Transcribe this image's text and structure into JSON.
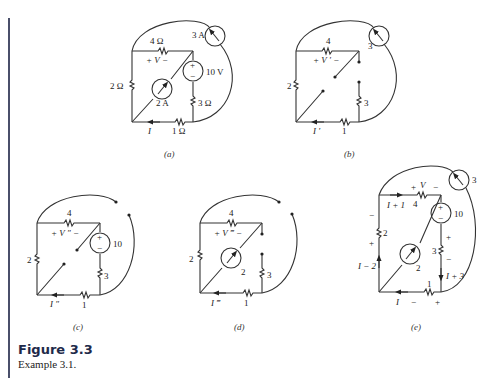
{
  "figure": {
    "title": "Figure 3.3",
    "caption": "Example 3.1."
  },
  "panels": {
    "a": {
      "label": "(a)",
      "r_top": "4 Ω",
      "r_left": "2 Ω",
      "r_right": "3 Ω",
      "r_bottom": "1 Ω",
      "v_source": "10 V",
      "v_plus": "+",
      "v_minus": "−",
      "i_source_diag": "2 A",
      "i_source_arc": "3 A",
      "voltage_label": "+  V  −",
      "current_label": "I"
    },
    "b": {
      "label": "(b)",
      "r_top": "4",
      "r_left": "2",
      "r_right": "3",
      "r_bottom": "1",
      "i_source_arc": "3",
      "voltage_label": "+ V ′ −",
      "current_label": "I ′"
    },
    "c": {
      "label": "(c)",
      "r_top": "4",
      "r_left": "2",
      "r_right": "3",
      "r_bottom": "1",
      "v_source": "10",
      "v_plus": "+",
      "v_minus": "−",
      "voltage_label": "+ V ″ −",
      "current_label": "I ″"
    },
    "d": {
      "label": "(d)",
      "r_top": "4",
      "r_left": "2",
      "r_right": "3",
      "r_bottom": "1",
      "i_source_diag": "2",
      "voltage_label": "+ V ‴ −",
      "current_label": "I ‴"
    },
    "e": {
      "label": "(e)",
      "r_top": "4",
      "r_left": "2",
      "r_right": "3",
      "r_bottom": "1",
      "v_source": "10",
      "v_plus": "+",
      "v_minus": "−",
      "i_source_diag": "2",
      "i_source_arc": "3",
      "top_v_plus": "+",
      "top_v_label": "V",
      "top_v_minus": "−",
      "i_top": "I + 1",
      "i_left": "I − 2",
      "i_right": "I + 3",
      "i_bottom": "I",
      "left_minus": "−",
      "left_plus": "+",
      "right_plus": "+",
      "right_minus": "−",
      "bottom_minus": "−",
      "bottom_plus": "+"
    }
  }
}
